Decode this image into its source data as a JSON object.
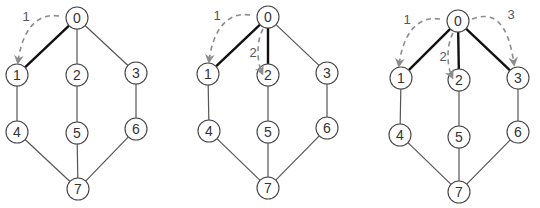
{
  "caption_fragment": "",
  "graph": {
    "nodes": [
      "0",
      "1",
      "2",
      "3",
      "4",
      "5",
      "6",
      "7"
    ],
    "edges": [
      [
        "0",
        "1"
      ],
      [
        "0",
        "2"
      ],
      [
        "0",
        "3"
      ],
      [
        "1",
        "4"
      ],
      [
        "2",
        "5"
      ],
      [
        "3",
        "6"
      ],
      [
        "4",
        "7"
      ],
      [
        "5",
        "7"
      ],
      [
        "6",
        "7"
      ]
    ]
  },
  "panels": [
    {
      "name": "step-1",
      "highlighted_edges": [
        [
          "0",
          "1"
        ]
      ],
      "traversal_arrows": [
        {
          "label": "1",
          "from": "0",
          "to": "1"
        }
      ]
    },
    {
      "name": "step-2",
      "highlighted_edges": [
        [
          "0",
          "1"
        ],
        [
          "0",
          "2"
        ]
      ],
      "traversal_arrows": [
        {
          "label": "1",
          "from": "0",
          "to": "1"
        },
        {
          "label": "2",
          "from": "0",
          "to": "2"
        }
      ]
    },
    {
      "name": "step-3",
      "highlighted_edges": [
        [
          "0",
          "1"
        ],
        [
          "0",
          "2"
        ],
        [
          "0",
          "3"
        ]
      ],
      "traversal_arrows": [
        {
          "label": "1",
          "from": "0",
          "to": "1"
        },
        {
          "label": "2",
          "from": "0",
          "to": "2"
        },
        {
          "label": "3",
          "from": "0",
          "to": "3"
        }
      ]
    }
  ],
  "colors": {
    "edge": "#555555",
    "highlighted_edge": "#111111",
    "node_stroke": "#444444",
    "node_fill": "#ffffff",
    "node_text": "#333333",
    "arrow": "#8c8c8c",
    "arrow_label": "#555555"
  }
}
